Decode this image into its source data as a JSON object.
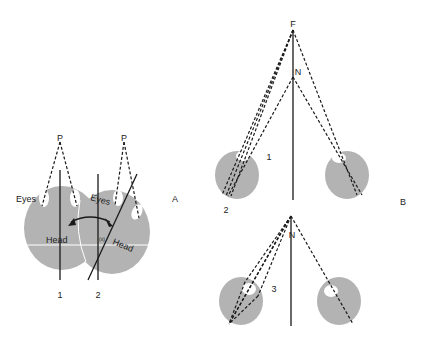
{
  "figure": {
    "panel_a": {
      "label": "A",
      "fixation_point_left": "P",
      "fixation_point_right": "P",
      "eyes_label_left": "Eyes",
      "eyes_label_right": "Eyes",
      "head_label_left": "Head",
      "head_label_right": "Head",
      "angle_label": "(x)",
      "position_1": "1",
      "position_2": "2"
    },
    "panel_b": {
      "label": "B",
      "far_point": "F",
      "near_point_top": "N",
      "near_point_bottom": "N",
      "case_1": "1",
      "case_2": "2",
      "case_3": "3"
    },
    "colors": {
      "head_fill": "#b3b3b3",
      "line": "#1a1a1a",
      "background": "#ffffff"
    }
  }
}
